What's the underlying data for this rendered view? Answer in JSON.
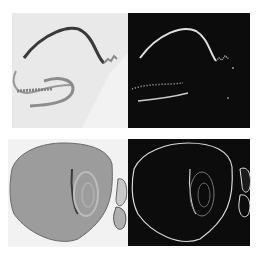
{
  "figure": {
    "layout": "2x2 grid",
    "panels": [
      {
        "id": "top-left",
        "content": "brightfield hippocampus section, dark stained curved cell layer",
        "background": "#e6e6e6"
      },
      {
        "id": "top-right",
        "content": "edge-detected hippocampus, bright curve on black",
        "background": "#0c0c0c"
      },
      {
        "id": "bottom-left",
        "content": "brightfield brain section, gray textured tissue",
        "background": "#f0f0f0"
      },
      {
        "id": "bottom-right",
        "content": "edge-detected brain section outline on black",
        "background": "#0c0c0c"
      }
    ],
    "colors": {
      "page": "#ffffff",
      "light_panel": "#e8e8e8",
      "dark_panel": "#0c0c0c",
      "stain_dark": "#3a3a3a",
      "tissue_gray": "#9a9a9a",
      "edge_bright": "#e0e0e0"
    }
  }
}
